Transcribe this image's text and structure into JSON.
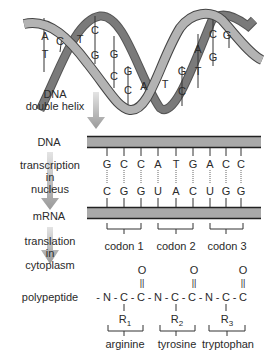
{
  "helix": {
    "label_line1": "DNA",
    "label_line2": "double helix",
    "pairs": [
      {
        "top": "A",
        "bottom": "T"
      },
      {
        "top": "C",
        "bottom": ""
      },
      {
        "top": "T",
        "bottom": ""
      },
      {
        "top": "C",
        "bottom": "G"
      },
      {
        "top": "G",
        "bottom": "C"
      },
      {
        "top": "G",
        "bottom": "C"
      },
      {
        "top": "A",
        "bottom": ""
      },
      {
        "top": "T",
        "bottom": ""
      },
      {
        "top": "G",
        "bottom": "C"
      },
      {
        "top": "A",
        "bottom": "T"
      },
      {
        "top": "C",
        "bottom": "G"
      },
      {
        "top": "G",
        "bottom": ""
      }
    ]
  },
  "stages": {
    "dna": "DNA",
    "transcription_1": "transcription",
    "transcription_2": "in",
    "transcription_3": "nucleus",
    "mrna": "mRNA",
    "translation_1": "translation",
    "translation_2": "in",
    "translation_3": "cytoplasm",
    "polypeptide": "polypeptide"
  },
  "dna_strand": [
    "G",
    "C",
    "C",
    "A",
    "T",
    "G",
    "A",
    "C",
    "C"
  ],
  "mrna_strand": [
    "C",
    "G",
    "G",
    "U",
    "A",
    "C",
    "U",
    "G",
    "G"
  ],
  "codons": [
    "codon 1",
    "codon 2",
    "codon 3"
  ],
  "polypeptide": {
    "backbone": [
      "-",
      "N",
      "-",
      "C",
      "-",
      "C",
      "-",
      "N",
      "-",
      "C",
      "-",
      "C",
      "-",
      "N",
      "-",
      "C",
      "-",
      "C"
    ],
    "carbonyl_O": "O",
    "double_bond": "||",
    "r_groups": [
      {
        "R": "R",
        "sub": "1"
      },
      {
        "R": "R",
        "sub": "2"
      },
      {
        "R": "R",
        "sub": "3"
      }
    ],
    "amino_acids": [
      "arginine",
      "tyrosine",
      "tryptophan"
    ]
  },
  "colors": {
    "strand_fill": "#a9a9a9",
    "strand_dark": "#6e6e6e",
    "strand_edge": "#333333",
    "arrow": "#a8a8a8",
    "text": "#2a2a2a"
  }
}
